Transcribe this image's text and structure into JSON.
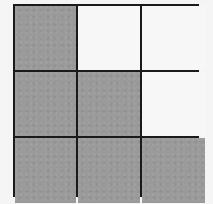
{
  "grid": {
    "rows": 3,
    "cols": 3,
    "colors": {
      "shaded": "#9a9a9a",
      "empty": "#f7f7f7",
      "line": "#1a1a1a"
    },
    "cells": [
      [
        "shaded",
        "empty",
        "empty"
      ],
      [
        "shaded",
        "shaded",
        "empty"
      ],
      [
        "shaded",
        "shaded",
        "shaded"
      ]
    ]
  }
}
